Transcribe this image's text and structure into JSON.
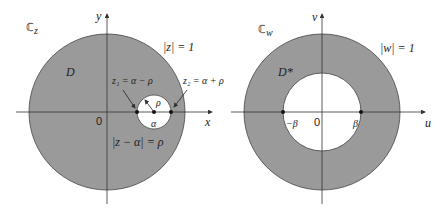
{
  "diagram": {
    "type": "conformal-map",
    "colors": {
      "fill": "#9a9a9a",
      "stroke": "#444444",
      "axis": "#333333",
      "background": "#ffffff"
    },
    "left_panel": {
      "plane_label": "ℂ",
      "plane_sub": "z",
      "x_axis_label": "x",
      "y_axis_label": "y",
      "origin_label": "0",
      "region_label": "D",
      "outer_circle_label": "|z| = 1",
      "inner_circle_label": "|z − α| = ρ",
      "center_label": "α",
      "radius_label": "ρ",
      "z1_label": "z₁ = α − ρ",
      "z2_label": "z₂ = α + ρ"
    },
    "right_panel": {
      "plane_label": "ℂ",
      "plane_sub": "w",
      "x_axis_label": "u",
      "y_axis_label": "v",
      "origin_label": "0",
      "region_label": "D*",
      "outer_circle_label": "|w| = 1",
      "neg_beta_label": "−β",
      "beta_label": "β"
    }
  }
}
